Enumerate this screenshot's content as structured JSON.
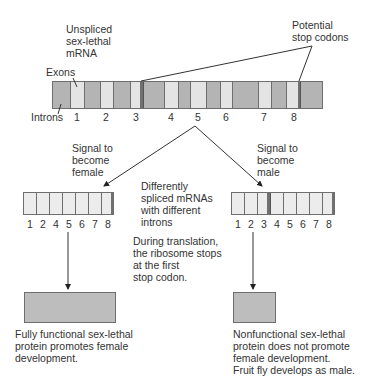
{
  "unspliced": {
    "title": "Unspliced\nsex-lethal\nmRNA",
    "exons_label": "Exons",
    "introns_label": "Introns",
    "stop_label": "Potential\nstop codons",
    "exon_numbers": [
      "1",
      "2",
      "3",
      "4",
      "5",
      "6",
      "7",
      "8"
    ]
  },
  "female": {
    "signal": "Signal to\nbecome\nfemale",
    "exon_numbers": [
      "1",
      "2",
      "4",
      "5",
      "6",
      "7",
      "8"
    ],
    "outcome": "Fully functional sex-lethal\nprotein promotes female\ndevelopment."
  },
  "male": {
    "signal": "Signal to\nbecome\nmale",
    "exon_numbers": [
      "1",
      "2",
      "3",
      "4",
      "5",
      "6",
      "7",
      "8"
    ],
    "outcome": "Nonfunctional sex-lethal\nprotein does not promote\nfemale development.\nFruit fly develops as male."
  },
  "middle": {
    "spliced_note": "Differently\nspliced mRNAs\nwith different\nintrons",
    "translation_note": "During translation,\nthe ribosome stops\nat the first\nstop codon."
  },
  "colors": {
    "intron": "#b4b4b4",
    "exon": "#e4e4e4",
    "stop_codon": "#707070",
    "protein": "#bdbdbd",
    "outline": "#6e6e6e"
  }
}
